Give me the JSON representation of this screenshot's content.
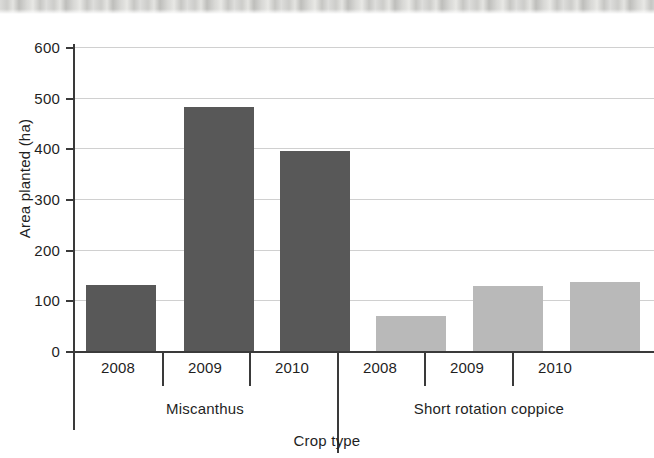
{
  "chart_data": {
    "type": "bar",
    "title": "",
    "xlabel": "Crop type",
    "ylabel": "Area planted (ha)",
    "ylim": [
      0,
      600
    ],
    "yticks": [
      0,
      100,
      200,
      300,
      400,
      500,
      600
    ],
    "ytick_labels": [
      "0",
      "100",
      "200",
      "300",
      "400",
      "500",
      "600"
    ],
    "grid": true,
    "legend": "none",
    "categories": [
      "2008",
      "2009",
      "2010",
      "2008",
      "2009",
      "2010"
    ],
    "groups": [
      {
        "label": "Miscanthus",
        "color": "#585858",
        "categories": [
          "2008",
          "2009",
          "2010"
        ],
        "values": [
          130,
          482,
          395
        ]
      },
      {
        "label": "Short rotation coppice",
        "color": "#b9b9b9",
        "categories": [
          "2008",
          "2009",
          "2010"
        ],
        "values": [
          70,
          128,
          137
        ]
      }
    ],
    "bars": [
      {
        "group": "Miscanthus",
        "category": "2008",
        "value": 130,
        "color": "#585858"
      },
      {
        "group": "Miscanthus",
        "category": "2009",
        "value": 482,
        "color": "#585858"
      },
      {
        "group": "Miscanthus",
        "category": "2010",
        "value": 395,
        "color": "#585858"
      },
      {
        "group": "Short rotation coppice",
        "category": "2008",
        "value": 70,
        "color": "#b9b9b9"
      },
      {
        "group": "Short rotation coppice",
        "category": "2009",
        "value": 128,
        "color": "#b9b9b9"
      },
      {
        "group": "Short rotation coppice",
        "category": "2010",
        "value": 137,
        "color": "#b9b9b9"
      }
    ]
  },
  "axes": {
    "y_title": "Area planted (ha)",
    "x_title": "Crop type",
    "y_labels": [
      "600",
      "500",
      "400",
      "300",
      "200",
      "100",
      "0"
    ]
  },
  "groups": {
    "left": "Miscanthus",
    "right": "Short rotation coppice"
  },
  "years": {
    "m2008": "2008",
    "m2009": "2009",
    "m2010": "2010",
    "s2008": "2008",
    "s2009": "2009",
    "s2010": "2010"
  },
  "colors": {
    "miscanthus": "#585858",
    "short_rotation_coppice": "#b9b9b9",
    "axis": "#3a3a3a",
    "grid": "#d0d0d0"
  }
}
